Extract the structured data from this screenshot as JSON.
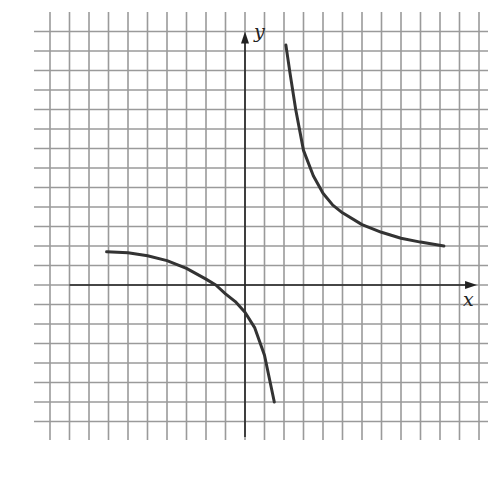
{
  "chart_data": {
    "type": "line",
    "title": "",
    "xlabel": "x",
    "ylabel": "y",
    "grid": true,
    "legend": null,
    "grid_unit_px": 19.5,
    "origin_px": [
      245,
      285
    ],
    "xlim": [
      -9,
      12
    ],
    "ylim": [
      -8,
      13
    ],
    "tick_labels": [],
    "series": [
      {
        "name": "right-branch",
        "x": [
          2.1,
          2.3,
          2.6,
          3.0,
          3.5,
          4.0,
          4.5,
          5.0,
          6.0,
          7.0,
          8.0,
          9.0,
          10.2
        ],
        "y": [
          12.3,
          10.9,
          9.0,
          6.9,
          5.6,
          4.7,
          4.1,
          3.7,
          3.1,
          2.7,
          2.4,
          2.2,
          2.0
        ]
      },
      {
        "name": "left-branch",
        "x": [
          -7.1,
          -6.0,
          -5.0,
          -4.0,
          -3.0,
          -2.0,
          -1.5,
          -1.0,
          -0.5,
          0.0,
          0.5,
          1.0,
          1.5
        ],
        "y": [
          1.7,
          1.65,
          1.5,
          1.25,
          0.85,
          0.3,
          0.0,
          -0.45,
          -0.85,
          -1.4,
          -2.2,
          -3.6,
          -6.0
        ]
      }
    ],
    "annotations": []
  },
  "labels": {
    "x_axis": "x",
    "y_axis": "y"
  },
  "colors": {
    "grid": "#9a9a9a",
    "axis": "#222222",
    "curve": "#333333",
    "background": "#ffffff"
  }
}
